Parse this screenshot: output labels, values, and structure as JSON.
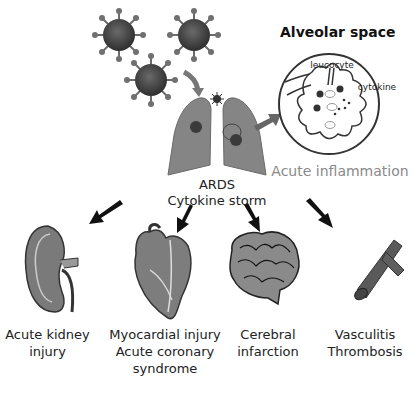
{
  "diagram": {
    "center": {
      "line1": "ARDS",
      "line2": "Cytokine storm"
    },
    "alveolar": {
      "title": "Alveolar space",
      "leucocyte_label": "leucocyte",
      "cytokine_label": "cytokine",
      "result": "Acute inflammation"
    },
    "organs": [
      {
        "name": "kidney",
        "line1": "Acute kidney",
        "line2": "injury",
        "line3": ""
      },
      {
        "name": "heart",
        "line1": "Myocardial injury",
        "line2": "Acute coronary",
        "line3": "syndrome"
      },
      {
        "name": "brain",
        "line1": "Cerebral",
        "line2": "infarction",
        "line3": ""
      },
      {
        "name": "vessel",
        "line1": "Vasculitis",
        "line2": "Thrombosis",
        "line3": ""
      }
    ],
    "colors": {
      "virus": "#4a4a4a",
      "lung": "#808080",
      "arrow": "#111111",
      "inflammation_text": "#8a8a8a"
    }
  }
}
